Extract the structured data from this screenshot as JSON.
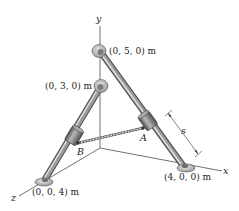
{
  "figure": {
    "axes": {
      "x_label": "x",
      "y_label": "y",
      "z_label": "z"
    },
    "points": {
      "p050": "(0, 5, 0) m",
      "p030": "(0, 3, 0) m",
      "p400": "(4, 0, 0) m",
      "p004": "(0, 0, 4) m"
    },
    "collars": {
      "a_label": "A",
      "b_label": "B"
    },
    "dimension": {
      "s_label": "s"
    },
    "colors": {
      "rod": "#8a8a8a",
      "rod_highlight": "#d4d4d4",
      "rod_dark": "#4a4a4a",
      "collar": "#9a9a9a",
      "support": "#c8c8c8",
      "line": "#333333"
    }
  }
}
